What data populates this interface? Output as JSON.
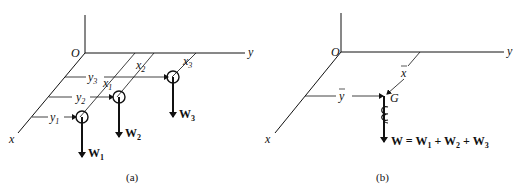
{
  "panel_a": {
    "caption": "(a)",
    "origin_label": "O",
    "axis_x_label": "x",
    "axis_y_label": "y",
    "weights": [
      {
        "label": "W",
        "sub": "1",
        "x_label": "x",
        "x_sub": "1",
        "y_label": "y",
        "y_sub": "1"
      },
      {
        "label": "W",
        "sub": "2",
        "x_label": "x",
        "x_sub": "2",
        "y_label": "y",
        "y_sub": "2"
      },
      {
        "label": "W",
        "sub": "3",
        "x_label": "x",
        "x_sub": "3",
        "y_label": "y",
        "y_sub": "3"
      }
    ]
  },
  "panel_b": {
    "caption": "(b)",
    "origin_label": "O",
    "axis_x_label": "x",
    "axis_y_label": "y",
    "xbar_label": "x",
    "ybar_label": "y",
    "centroid_label": "G",
    "resultant": {
      "lhs": "W = W",
      "s1": "1",
      "plus1": " + W",
      "s2": "2",
      "plus2": " + W",
      "s3": "3"
    }
  }
}
